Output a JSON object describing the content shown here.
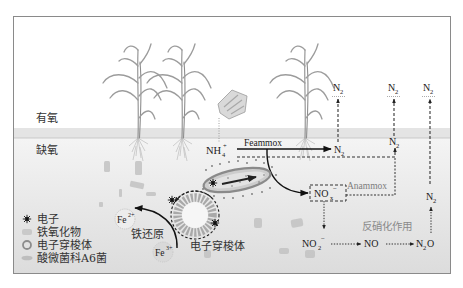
{
  "zones": {
    "oxic_label": "有氧",
    "anoxic_label": "缺氧"
  },
  "nitrogen": {
    "ammonium": {
      "base": "NH",
      "sub": "4",
      "sup": "+"
    },
    "dinitrogen": {
      "base": "N",
      "sub": "2"
    },
    "nox_box": {
      "base": "NO",
      "sub": "x",
      "sup": "−"
    },
    "nitrite": {
      "base": "NO",
      "sub": "2",
      "sup": "−"
    },
    "nitric_oxide": {
      "base": "NO"
    },
    "nitrous_oxide": {
      "base": "N",
      "sub": "2",
      "tail": "O"
    }
  },
  "processes": {
    "feammox": "Feammox",
    "anammox": "Anammox",
    "denitrification": "反硝化作用",
    "iron_reduction": "铁还原"
  },
  "iron": {
    "ferrous": {
      "base": "Fe",
      "sup": "2+"
    },
    "ferric": {
      "base": "Fe",
      "sup": "3+"
    }
  },
  "shuttle_label": "电子穿梭体",
  "legend": {
    "items": [
      {
        "icon": "electron-star-icon",
        "label": "电子"
      },
      {
        "icon": "iron-oxide-icon",
        "label": "铁氧化物"
      },
      {
        "icon": "electron-shuttle-ring-icon",
        "label": "电子穿梭体"
      },
      {
        "icon": "acidimicrobiaceae-a6-rod-icon",
        "label": "酸微菌科A6菌"
      }
    ]
  },
  "colors": {
    "frame": "#8a8a8a",
    "oxic_anoxic_band": "#e4e4e4",
    "soil_top": "#f4f4f4",
    "soil_bottom": "#dedede",
    "arrow": "#111111",
    "process_label_gray": "#7d7d7d"
  }
}
